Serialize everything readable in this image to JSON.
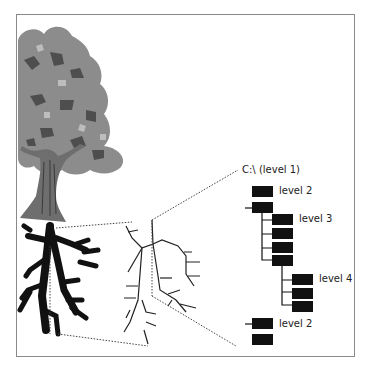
{
  "diagram": {
    "root_label": "C:\\ (level 1)",
    "levels": [
      {
        "label": "level 2",
        "group": "top"
      },
      {
        "label": "level 3",
        "group": "middle"
      },
      {
        "label": "level 4",
        "group": "deep"
      },
      {
        "label": "level 2",
        "group": "bottom"
      }
    ],
    "nodes": {
      "level2_top_count": 2,
      "level3_count": 4,
      "level4_count": 3,
      "level2_bottom_count": 2
    },
    "panels": [
      {
        "name": "tree-illustration",
        "description": "Tree with leafy canopy, trunk and black roots"
      },
      {
        "name": "root-line-drawing",
        "description": "Zoomed line drawing of the root branches"
      },
      {
        "name": "folder-hierarchy",
        "description": "Directory structure with black folder blocks"
      }
    ],
    "colors": {
      "canopy": "#8c8c8c",
      "canopy_dark": "#555555",
      "trunk": "#6e6e6e",
      "roots": "#111111",
      "folder": "#111111",
      "frame": "#8a8a8a",
      "dotted": "#444444"
    }
  }
}
